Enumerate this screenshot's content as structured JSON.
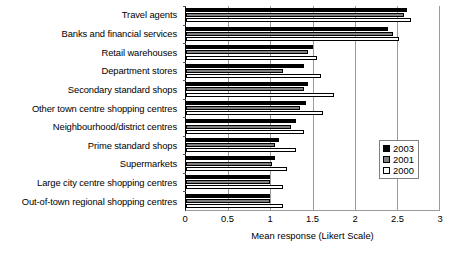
{
  "chart_data": {
    "type": "bar",
    "orientation": "horizontal",
    "title": "",
    "xlabel": "Mean response (Likert Scale)",
    "ylabel": "",
    "xlim": [
      0,
      3
    ],
    "xticks": [
      "0",
      "0.5",
      "1",
      "1.5",
      "2",
      "2.5",
      "3"
    ],
    "xtick_values": [
      0,
      0.5,
      1,
      1.5,
      2,
      2.5,
      3
    ],
    "grid": true,
    "legend_position": "right-middle",
    "categories": [
      "Travel agents",
      "Banks and financial services",
      "Retail warehouses",
      "Department stores",
      "Secondary standard shops",
      "Other town centre shopping centres",
      "Neighbourhood/district centres",
      "Prime standard shops",
      "Supermarkets",
      "Large city centre shopping centres",
      "Out-of-town regional shopping centres"
    ],
    "series": [
      {
        "name": "2003",
        "color": "#000000",
        "values": [
          2.62,
          2.4,
          1.5,
          1.4,
          1.45,
          1.42,
          1.3,
          1.1,
          1.05,
          1.0,
          1.0
        ]
      },
      {
        "name": "2001",
        "color": "#808080",
        "values": [
          2.58,
          2.45,
          1.45,
          1.15,
          1.4,
          1.35,
          1.25,
          1.05,
          1.02,
          1.0,
          1.0
        ]
      },
      {
        "name": "2000",
        "color": "#ffffff",
        "values": [
          2.67,
          2.52,
          1.55,
          1.6,
          1.75,
          1.62,
          1.4,
          1.3,
          1.2,
          1.15,
          1.15
        ]
      }
    ]
  },
  "legend": {
    "items": [
      {
        "label": "2003",
        "key": "y2003"
      },
      {
        "label": "2001",
        "key": "y2001"
      },
      {
        "label": "2000",
        "key": "y2000"
      }
    ]
  }
}
